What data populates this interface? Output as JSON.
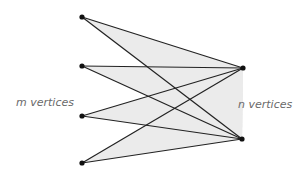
{
  "diagram": {
    "type": "complete bipartite graph",
    "left_label": "m vertices",
    "right_label": "n vertices",
    "left_vertices": [
      [
        82,
        17
      ],
      [
        82,
        66
      ],
      [
        82,
        116
      ],
      [
        82,
        163
      ]
    ],
    "right_vertices": [
      [
        243,
        68
      ],
      [
        242,
        139
      ]
    ],
    "colors": {
      "edge": "#222222",
      "fill": "#ebebeb",
      "vertex": "#111111",
      "label": "#6a6a6a"
    }
  }
}
